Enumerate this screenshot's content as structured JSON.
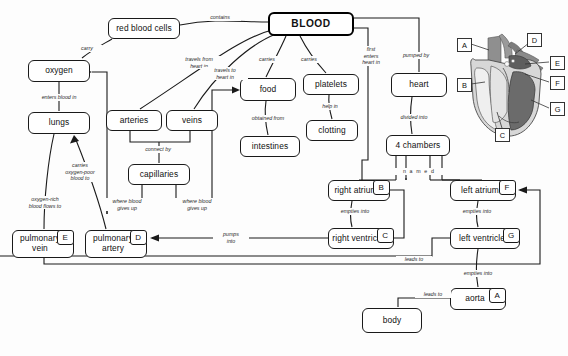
{
  "diagram": {
    "root_label": "BLOOD",
    "nodes": [
      {
        "id": "blood",
        "label": "BLOOD",
        "tag": "",
        "x": 268,
        "y": 12,
        "w": 86,
        "h": 24,
        "root": true
      },
      {
        "id": "red_blood_cells",
        "label": "red blood cells",
        "tag": "",
        "x": 108,
        "y": 18,
        "w": 72,
        "h": 21
      },
      {
        "id": "oxygen",
        "label": "oxygen",
        "tag": "",
        "x": 28,
        "y": 60,
        "w": 62,
        "h": 22
      },
      {
        "id": "lungs",
        "label": "lungs",
        "tag": "",
        "x": 28,
        "y": 112,
        "w": 62,
        "h": 22
      },
      {
        "id": "arteries",
        "label": "arteries",
        "tag": "",
        "x": 106,
        "y": 110,
        "w": 56,
        "h": 21
      },
      {
        "id": "veins",
        "label": "veins",
        "tag": "",
        "x": 166,
        "y": 110,
        "w": 52,
        "h": 21
      },
      {
        "id": "capillaries",
        "label": "capillaries",
        "tag": "",
        "x": 128,
        "y": 164,
        "w": 62,
        "h": 21
      },
      {
        "id": "food",
        "label": "food",
        "tag": "",
        "x": 240,
        "y": 78,
        "w": 56,
        "h": 23
      },
      {
        "id": "intestines",
        "label": "intestines",
        "tag": "",
        "x": 240,
        "y": 136,
        "w": 60,
        "h": 21
      },
      {
        "id": "platelets",
        "label": "platelets",
        "tag": "",
        "x": 303,
        "y": 74,
        "w": 56,
        "h": 21
      },
      {
        "id": "clotting",
        "label": "clotting",
        "tag": "",
        "x": 306,
        "y": 120,
        "w": 52,
        "h": 21
      },
      {
        "id": "heart",
        "label": "heart",
        "tag": "",
        "x": 391,
        "y": 73,
        "w": 56,
        "h": 24
      },
      {
        "id": "four_chambers",
        "label": "4 chambers",
        "tag": "",
        "x": 386,
        "y": 135,
        "w": 64,
        "h": 21
      },
      {
        "id": "right_atrium",
        "label": "right atrium",
        "tag": "B",
        "x": 328,
        "y": 180,
        "w": 62,
        "h": 21
      },
      {
        "id": "right_ventricle",
        "label": "right ventricle",
        "tag": "C",
        "x": 328,
        "y": 228,
        "w": 66,
        "h": 21
      },
      {
        "id": "left_atrium",
        "label": "left atrium",
        "tag": "F",
        "x": 450,
        "y": 180,
        "w": 66,
        "h": 21
      },
      {
        "id": "left_ventricle",
        "label": "left ventricle",
        "tag": "G",
        "x": 450,
        "y": 228,
        "w": 70,
        "h": 21
      },
      {
        "id": "pulmonary_vein",
        "label": "pulmonary vein",
        "tag": "E",
        "x": 12,
        "y": 230,
        "w": 62,
        "h": 28
      },
      {
        "id": "pulmonary_artery",
        "label": "pulmonary artery",
        "tag": "D",
        "x": 85,
        "y": 230,
        "w": 62,
        "h": 28
      },
      {
        "id": "aorta",
        "label": "aorta",
        "tag": "A",
        "x": 450,
        "y": 288,
        "w": 56,
        "h": 22
      },
      {
        "id": "body",
        "label": "body",
        "tag": "",
        "x": 362,
        "y": 308,
        "w": 60,
        "h": 25
      }
    ],
    "link_labels": [
      {
        "id": "contains",
        "text": "contains",
        "x": 199,
        "y": 14,
        "w": 40
      },
      {
        "id": "carry",
        "text": "carry",
        "x": 72,
        "y": 45,
        "w": 28
      },
      {
        "id": "enters_blood_in",
        "text": "enters blood in",
        "x": 27,
        "y": 94,
        "w": 62
      },
      {
        "id": "travels_from",
        "text": "travels from\nheart in",
        "x": 174,
        "y": 56,
        "w": 48
      },
      {
        "id": "travels_to",
        "text": "travels to\nheart in",
        "x": 202,
        "y": 67,
        "w": 44
      },
      {
        "id": "carries_food",
        "text": "carries",
        "x": 252,
        "y": 56,
        "w": 28
      },
      {
        "id": "carries_platelets",
        "text": "carries",
        "x": 294,
        "y": 56,
        "w": 28
      },
      {
        "id": "first_enters",
        "text": "first\nenters\nheart in",
        "x": 354,
        "y": 46,
        "w": 32
      },
      {
        "id": "pumped_by",
        "text": "pumped by",
        "x": 391,
        "y": 52,
        "w": 48
      },
      {
        "id": "divided_into",
        "text": "divided into",
        "x": 389,
        "y": 114,
        "w": 48
      },
      {
        "id": "named",
        "text": "n a m e d",
        "x": 393,
        "y": 168,
        "w": 50
      },
      {
        "id": "obtained_from",
        "text": "obtained from",
        "x": 240,
        "y": 115,
        "w": 54
      },
      {
        "id": "help_in",
        "text": "help in",
        "x": 313,
        "y": 103,
        "w": 32
      },
      {
        "id": "connect_by",
        "text": "connect by",
        "x": 133,
        "y": 146,
        "w": 48
      },
      {
        "id": "where_gives_up_1",
        "text": "where blood\ngives up",
        "x": 102,
        "y": 198,
        "w": 48
      },
      {
        "id": "where_gives_up_2",
        "text": "where blood\ngives up",
        "x": 172,
        "y": 198,
        "w": 48
      },
      {
        "id": "carries_oxygen_poor",
        "text": "carries\noxygen-poor\nblood to",
        "x": 54,
        "y": 162,
        "w": 50
      },
      {
        "id": "oxygen_rich",
        "text": "oxygen-rich\nblood flows to",
        "x": 16,
        "y": 196,
        "w": 56
      },
      {
        "id": "pumps_into",
        "text": "pumps\ninto",
        "x": 213,
        "y": 231,
        "w": 34
      },
      {
        "id": "empties_into_right",
        "text": "empties into",
        "x": 330,
        "y": 208,
        "w": 48
      },
      {
        "id": "empties_into_left",
        "text": "empties into",
        "x": 452,
        "y": 208,
        "w": 48
      },
      {
        "id": "leads_to_lv",
        "text": "leads to",
        "x": 396,
        "y": 256,
        "w": 34
      },
      {
        "id": "empties_into_aorta",
        "text": "empties into",
        "x": 453,
        "y": 270,
        "w": 48
      },
      {
        "id": "leads_to_body",
        "text": "leads to",
        "x": 415,
        "y": 291,
        "w": 34
      }
    ],
    "heart_figure": {
      "caption": "heart anatomy diagram",
      "labels": [
        {
          "id": "A",
          "text": "A",
          "x": 2,
          "y": 14
        },
        {
          "id": "D",
          "text": "D",
          "x": 72,
          "y": 9
        },
        {
          "id": "E",
          "text": "E",
          "x": 95,
          "y": 32
        },
        {
          "id": "B",
          "text": "B",
          "x": 2,
          "y": 54
        },
        {
          "id": "F",
          "text": "F",
          "x": 95,
          "y": 52
        },
        {
          "id": "G",
          "text": "G",
          "x": 95,
          "y": 78
        },
        {
          "id": "C",
          "text": "C",
          "x": 40,
          "y": 104
        }
      ]
    }
  }
}
